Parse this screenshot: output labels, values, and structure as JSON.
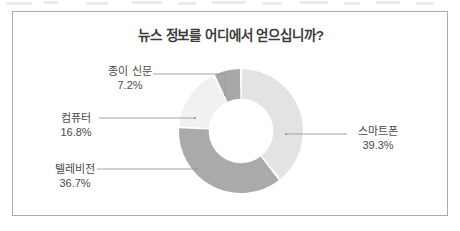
{
  "figure": {
    "title": "뉴스 정보를 어디에서 얻으십니까?",
    "border_color": "#a9a9a9",
    "background": "#ffffff"
  },
  "chart_data": {
    "type": "pie",
    "variant": "donut",
    "title": "뉴스 정보를 어디에서 얻으십니까?",
    "xlabel": "",
    "ylabel": "",
    "unit": "%",
    "grid": false,
    "legend": "none",
    "label_style": "callout-with-leader-line",
    "start_angle_deg": 0,
    "direction": "clockwise",
    "inner_radius_ratio": 0.52,
    "categories": [
      "스마트폰",
      "텔레비전",
      "컴퓨터",
      "종이 신문"
    ],
    "values": [
      39.3,
      36.7,
      16.8,
      7.2
    ],
    "value_labels": [
      "39.3%",
      "36.7%",
      "16.8%",
      "7.2%"
    ],
    "colors": [
      "#e3e3e1",
      "#aaaaa8",
      "#f1f1ef",
      "#a8a8a6"
    ],
    "slices": [
      {
        "label": "스마트폰",
        "value": 39.3,
        "value_label": "39.3%",
        "color": "#e3e3e1"
      },
      {
        "label": "텔레비전",
        "value": 36.7,
        "value_label": "36.7%",
        "color": "#aaaaa8"
      },
      {
        "label": "컴퓨터",
        "value": 16.8,
        "value_label": "16.8%",
        "color": "#f1f1ef"
      },
      {
        "label": "종이 신문",
        "value": 7.2,
        "value_label": "7.2%",
        "color": "#a8a8a6"
      }
    ]
  },
  "callouts": {
    "paper": {
      "category": "종이 신문",
      "percent": "7.2%"
    },
    "computer": {
      "category": "컴퓨터",
      "percent": "16.8%"
    },
    "television": {
      "category": "텔레비전",
      "percent": "36.7%"
    },
    "smartphone": {
      "category": "스마트폰",
      "percent": "39.3%"
    }
  }
}
